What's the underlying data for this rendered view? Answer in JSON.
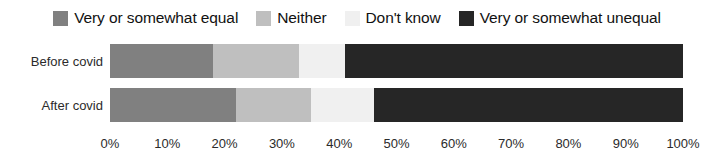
{
  "chart_data": {
    "type": "bar",
    "orientation": "horizontal",
    "stacked": true,
    "normalized": true,
    "title": "",
    "xlabel": "",
    "ylabel": "",
    "xlim": [
      0,
      100
    ],
    "grid": false,
    "legend_position": "top",
    "categories": [
      "Before covid",
      "After covid"
    ],
    "tick_labels": [
      "0%",
      "10%",
      "20%",
      "30%",
      "40%",
      "50%",
      "60%",
      "70%",
      "80%",
      "90%",
      "100%"
    ],
    "tick_values": [
      0,
      10,
      20,
      30,
      40,
      50,
      60,
      70,
      80,
      90,
      100
    ],
    "series": [
      {
        "name": "Very or somewhat equal",
        "color": "#808080",
        "values": [
          18,
          22
        ]
      },
      {
        "name": "Neither",
        "color": "#bfbfbf",
        "values": [
          15,
          13
        ]
      },
      {
        "name": "Don't know",
        "color": "#f0f0f0",
        "values": [
          8,
          11
        ]
      },
      {
        "name": "Very or somewhat unequal",
        "color": "#262626",
        "values": [
          59,
          54
        ]
      }
    ]
  },
  "legend": {
    "items": [
      {
        "label": "Very or somewhat equal",
        "color": "#808080"
      },
      {
        "label": "Neither",
        "color": "#bfbfbf"
      },
      {
        "label": "Don't know",
        "color": "#f0f0f0"
      },
      {
        "label": "Very or somewhat unequal",
        "color": "#262626"
      }
    ]
  }
}
